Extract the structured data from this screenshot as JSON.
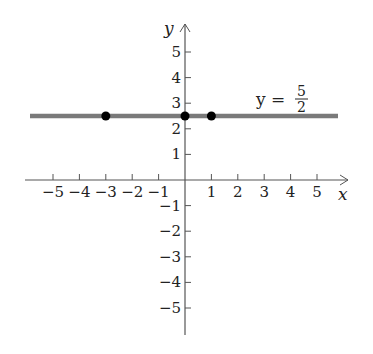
{
  "chart_data": {
    "type": "line",
    "title": "",
    "xlabel": "x",
    "ylabel": "y",
    "xlim": [
      -6,
      6
    ],
    "ylim": [
      -6,
      6
    ],
    "grid": false,
    "x_ticks": [
      -5,
      -4,
      -3,
      -2,
      -1,
      1,
      2,
      3,
      4,
      5
    ],
    "y_ticks": [
      -5,
      -4,
      -3,
      -2,
      -1,
      1,
      2,
      3,
      4,
      5
    ],
    "series": [
      {
        "name": "y = 5/2",
        "equation": "y = 5/2",
        "x": [
          -6,
          6
        ],
        "y": [
          2.5,
          2.5
        ],
        "color": "#7a7a7a"
      }
    ],
    "points": [
      {
        "x": -3,
        "y": 2.5
      },
      {
        "x": 0,
        "y": 2.5
      },
      {
        "x": 1,
        "y": 2.5
      }
    ],
    "annotations": [
      {
        "text": "y = 5/2",
        "x": 3.5,
        "y": 3.2
      }
    ]
  },
  "labels": {
    "x_axis": "x",
    "y_axis": "y",
    "equation_lhs": "y =",
    "equation_num": "5",
    "equation_den": "2"
  },
  "colors": {
    "axis": "#555555",
    "line": "#7a7a7a",
    "point": "#000000",
    "text": "#222222"
  }
}
